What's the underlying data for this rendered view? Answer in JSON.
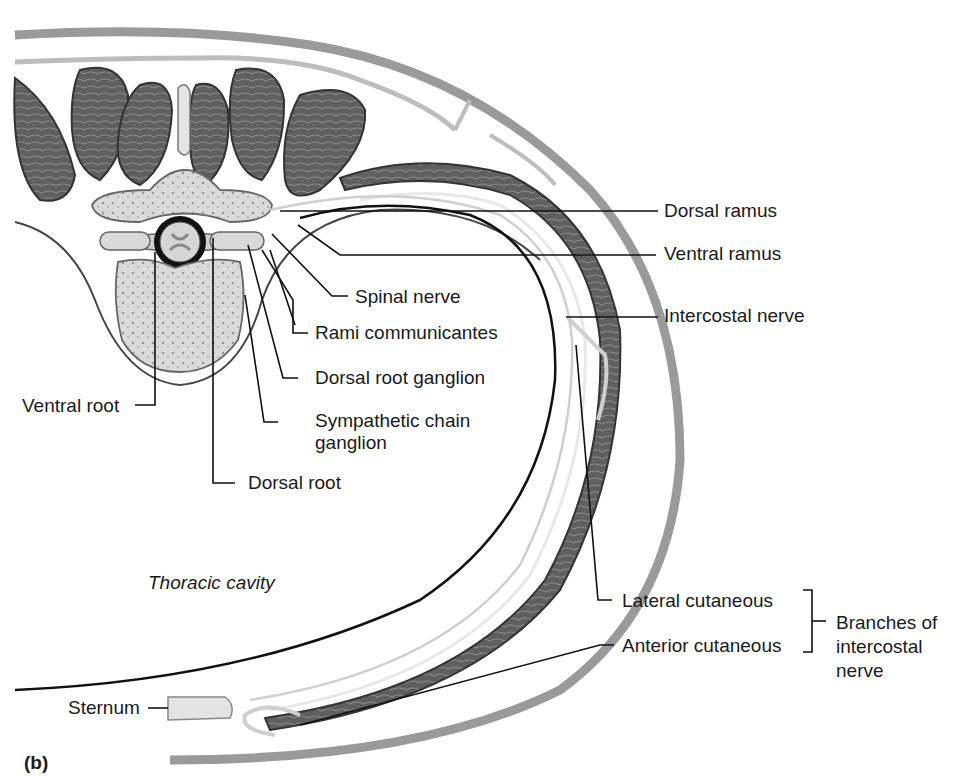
{
  "figure": {
    "panel_label": "(b)",
    "region_label": "Thoracic cavity"
  },
  "labels": {
    "dorsal_ramus": "Dorsal ramus",
    "ventral_ramus": "Ventral ramus",
    "spinal_nerve": "Spinal nerve",
    "rami_communicantes": "Rami communicantes",
    "intercostal_nerve": "Intercostal nerve",
    "dorsal_root_ganglion": "Dorsal root ganglion",
    "ventral_root": "Ventral root",
    "sympathetic_chain_ganglion_1": "Sympathetic chain",
    "sympathetic_chain_ganglion_2": "ganglion",
    "dorsal_root": "Dorsal root",
    "lateral_cutaneous": "Lateral cutaneous",
    "anterior_cutaneous": "Anterior cutaneous",
    "branches_1": "Branches of",
    "branches_2": "intercostal",
    "branches_3": "nerve",
    "sternum": "Sternum"
  },
  "colors": {
    "muscle": "#5e5e5e",
    "muscle_dark": "#3a3a3a",
    "bone": "#d9d9d9",
    "nerve": "#cfcfcf",
    "skin": "#9a9a9a",
    "line": "#111111"
  }
}
